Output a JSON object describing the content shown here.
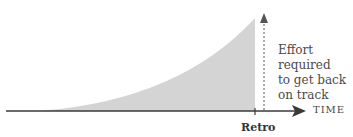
{
  "diagram": {
    "annotation": [
      "Effort required",
      "to get back",
      "on track"
    ],
    "axis_label": "TIME",
    "marker_label": "Retro",
    "colors": {
      "fill": "#d4d4d4",
      "axis": "#3a3a3a",
      "text": "#4a4a4a"
    }
  }
}
